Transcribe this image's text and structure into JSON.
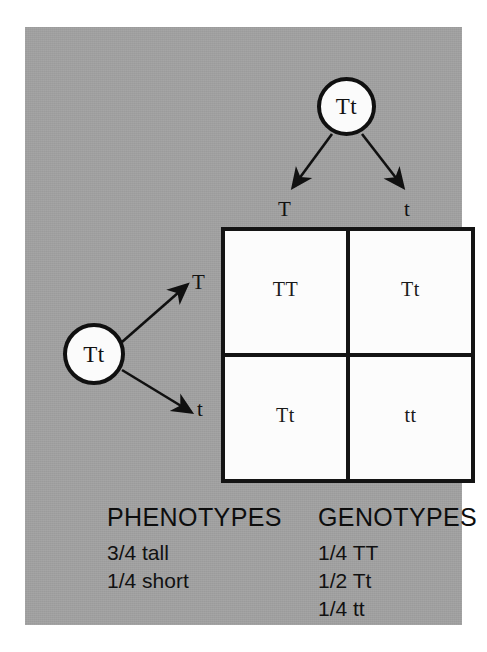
{
  "figure": {
    "background_color": "#a2a2a2",
    "page_color": "#ffffff",
    "ink_color": "#111111",
    "cell_fill": "#fcfcfc"
  },
  "parents": {
    "top": {
      "genotype": "Tt",
      "icon": "parent-circle-icon"
    },
    "left": {
      "genotype": "Tt",
      "icon": "parent-circle-icon"
    }
  },
  "gametes": {
    "top": [
      {
        "allele": "T"
      },
      {
        "allele": "t"
      }
    ],
    "left": [
      {
        "allele": "T"
      },
      {
        "allele": "t"
      }
    ]
  },
  "punnett": {
    "columns": [
      "T",
      "t"
    ],
    "rows": [
      "T",
      "t"
    ],
    "cells": [
      {
        "genotype": "TT"
      },
      {
        "genotype": "Tt"
      },
      {
        "genotype": "Tt"
      },
      {
        "genotype": "tt"
      }
    ]
  },
  "legend": {
    "phenotypes": {
      "heading": "PHENOTYPES",
      "items": [
        "3/4 tall",
        "1/4 short"
      ]
    },
    "genotypes": {
      "heading": "GENOTYPES",
      "items": [
        "1/4 TT",
        "1/2 Tt",
        "1/4 tt"
      ]
    }
  }
}
